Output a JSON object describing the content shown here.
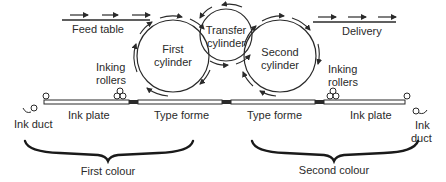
{
  "diagram": {
    "type": "two-colour printing press schematic",
    "labels": {
      "feed_table": "Feed table",
      "delivery": "Delivery",
      "first_cylinder_l1": "First",
      "first_cylinder_l2": "cylinder",
      "transfer_cylinder_l1": "Transfer",
      "transfer_cylinder_l2": "cylinder",
      "second_cylinder_l1": "Second",
      "second_cylinder_l2": "cylinder",
      "inking_rollers_left_l1": "Inking",
      "inking_rollers_left_l2": "rollers",
      "inking_rollers_right_l1": "Inking",
      "inking_rollers_right_l2": "rollers",
      "ink_duct_left": "Ink duct",
      "ink_duct_right_l1": "Ink",
      "ink_duct_right_l2": "duct",
      "ink_plate_left": "Ink plate",
      "type_forme_left": "Type forme",
      "type_forme_right": "Type forme",
      "ink_plate_right": "Ink plate",
      "first_colour": "First colour",
      "second_colour": "Second colour"
    },
    "colors": {
      "stroke": "#2a2a2a",
      "background": "#ffffff"
    }
  }
}
